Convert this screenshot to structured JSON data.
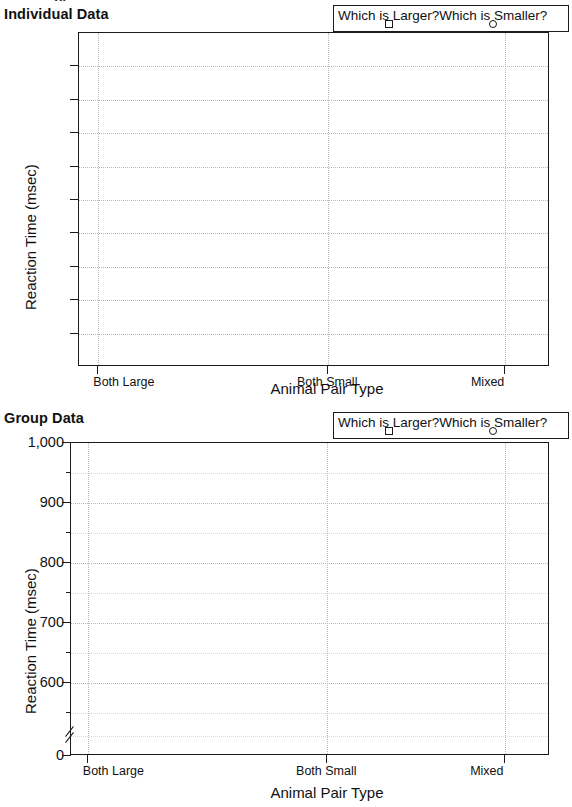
{
  "top_artifact": "jy",
  "panels": [
    {
      "id": "individual",
      "title": "Individual Data",
      "yaxis_title": "Reaction Time (msec)",
      "xaxis_title": "Animal Pair Type"
    },
    {
      "id": "group",
      "title": "Group Data",
      "yaxis_title": "Reaction Time (msec)",
      "xaxis_title": "Animal Pair Type"
    }
  ],
  "legend": {
    "entries": [
      {
        "label": "Which is Larger?",
        "marker": "square-marker"
      },
      {
        "label": "Which is Smaller?",
        "marker": "circle-marker"
      }
    ]
  },
  "chart_data": [
    {
      "type": "line",
      "title": "Individual Data",
      "xlabel": "Animal Pair Type",
      "ylabel": "Reaction Time (msec)",
      "categories": [
        "Both Large",
        "Both Small",
        "Mixed"
      ],
      "xtick_labels": [
        "Both Large",
        "Both Small",
        "Mixed"
      ],
      "ytick_labels": [],
      "ylim": null,
      "grid": true,
      "legend_position": "top-right",
      "series": [
        {
          "name": "Which is Larger?",
          "marker": "square",
          "values": []
        },
        {
          "name": "Which is Smaller?",
          "marker": "circle",
          "values": []
        }
      ],
      "note": "empty plot template: axes, ticks and gridlines only, no data plotted"
    },
    {
      "type": "line",
      "title": "Group Data",
      "xlabel": "Animal Pair Type",
      "ylabel": "Reaction Time (msec)",
      "categories": [
        "Both Large",
        "Both Small",
        "Mixed"
      ],
      "xtick_labels": [
        "Both Large",
        "Both Small",
        "Mixed"
      ],
      "ytick_labels": [
        "1,000",
        "900",
        "800",
        "700",
        "600",
        "0"
      ],
      "ylim": [
        600,
        1000
      ],
      "axis_break": true,
      "axis_break_below": 600,
      "grid": true,
      "legend_position": "top-right",
      "series": [
        {
          "name": "Which is Larger?",
          "marker": "square",
          "values": []
        },
        {
          "name": "Which is Smaller?",
          "marker": "circle",
          "values": []
        }
      ],
      "note": "empty plot template: axes, ticks and gridlines only, no data plotted"
    }
  ],
  "colors": {
    "ink": "#1a1a1a",
    "grid": "#b8b8b8",
    "grid_minor": "#d6d6d6",
    "background": "#ffffff"
  }
}
